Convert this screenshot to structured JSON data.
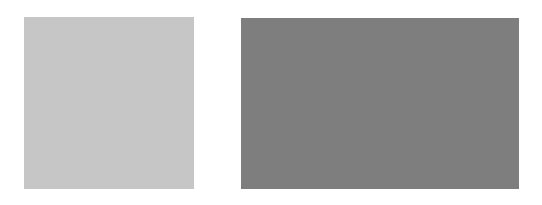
{
  "swatches": [
    {
      "color": "#c6c6c6"
    },
    {
      "color": "#7e7e7e"
    }
  ]
}
